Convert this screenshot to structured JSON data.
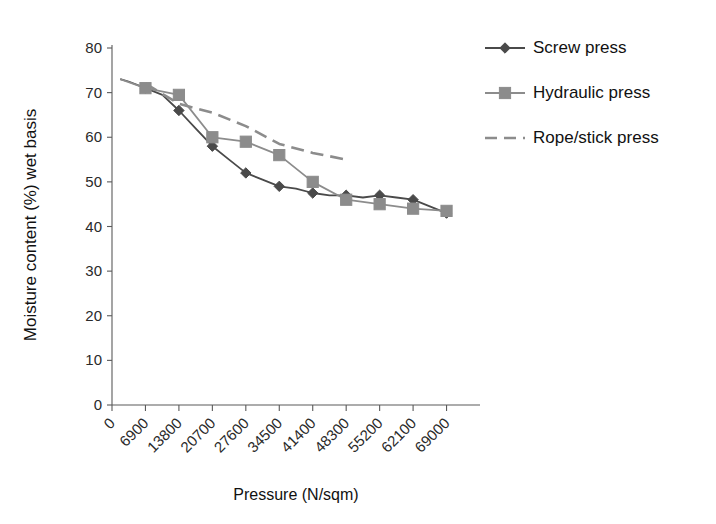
{
  "chart_data": {
    "type": "line",
    "title": "",
    "xlabel": "Pressure (N/sqm)",
    "ylabel": "Moisture content (%) wet basis",
    "categories": [
      0,
      6900,
      13800,
      20700,
      27600,
      34500,
      41400,
      48300,
      55200,
      62100,
      69000
    ],
    "xtick_labels": [
      "0",
      "6900",
      "13800",
      "20700",
      "27600",
      "34500",
      "41400",
      "48300",
      "55200",
      "62100",
      "69000"
    ],
    "ytick_labels": [
      "0",
      "10",
      "20",
      "30",
      "40",
      "50",
      "60",
      "70",
      "80"
    ],
    "yticks": [
      0,
      10,
      20,
      30,
      40,
      50,
      60,
      70,
      80
    ],
    "xlim": [
      0,
      75900
    ],
    "ylim": [
      0,
      80
    ],
    "grid": false,
    "legend_position": "top-right",
    "series": [
      {
        "name": "Screw press",
        "marker": "diamond",
        "color": "#4a4a4a",
        "dash": "none",
        "x": [
          1700,
          3400,
          6900,
          10400,
          13800,
          17250,
          20700,
          24150,
          27600,
          31050,
          34500,
          37950,
          41400,
          44850,
          48300,
          51750,
          55200,
          58650,
          62100,
          65550,
          69000
        ],
        "y": [
          73.0,
          72.5,
          71.0,
          69.5,
          66.0,
          62.0,
          58.0,
          55.0,
          52.0,
          50.5,
          49.0,
          48.5,
          47.5,
          47.0,
          47.0,
          46.5,
          47.0,
          46.5,
          46.0,
          44.5,
          43.0
        ]
      },
      {
        "name": "Hydraulic press",
        "marker": "square",
        "color": "#8c8c8c",
        "dash": "none",
        "x": [
          1700,
          6900,
          13800,
          20700,
          27600,
          34500,
          41400,
          48300,
          55200,
          62100,
          69000
        ],
        "y": [
          73.0,
          71.0,
          69.5,
          60.0,
          59.0,
          56.0,
          50.0,
          46.0,
          45.0,
          44.0,
          43.5
        ],
        "y_trailing": [
          46.0,
          45.0,
          44.0,
          43.5,
          41.5
        ]
      },
      {
        "name": "Rope/stick press",
        "marker": "none",
        "color": "#8c8c8c",
        "dash": "dashed",
        "x": [
          6900,
          13800,
          20700,
          27600,
          34500,
          41400,
          48300
        ],
        "y": [
          72.0,
          67.5,
          65.5,
          62.5,
          58.5,
          56.5,
          55.0
        ]
      }
    ]
  },
  "legend": {
    "items": [
      {
        "label": "Screw press",
        "marker": "diamond",
        "color": "#4a4a4a",
        "dash": "none"
      },
      {
        "label": "Hydraulic press",
        "marker": "square",
        "color": "#8c8c8c",
        "dash": "none"
      },
      {
        "label": "Rope/stick press",
        "marker": "none",
        "color": "#8c8c8c",
        "dash": "dashed"
      }
    ]
  },
  "colors": {
    "screw": "#4a4a4a",
    "hydraulic": "#8c8c8c",
    "rope": "#8c8c8c",
    "axis": "#5a5a5a",
    "text": "#111111",
    "background": "#ffffff"
  }
}
